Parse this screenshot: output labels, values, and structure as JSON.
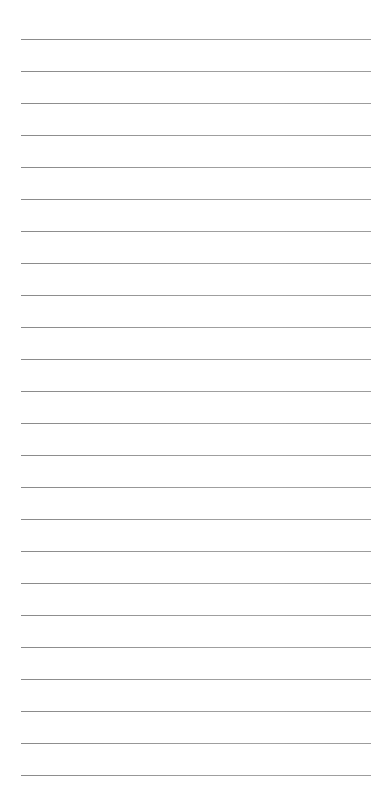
{
  "page": {
    "type": "lined-paper",
    "background_color": "#ffffff",
    "rule_color": "#999999",
    "rule_count": 24,
    "first_rule_y": 39,
    "rule_spacing": 32,
    "rule_left": 21,
    "rule_width": 350
  }
}
